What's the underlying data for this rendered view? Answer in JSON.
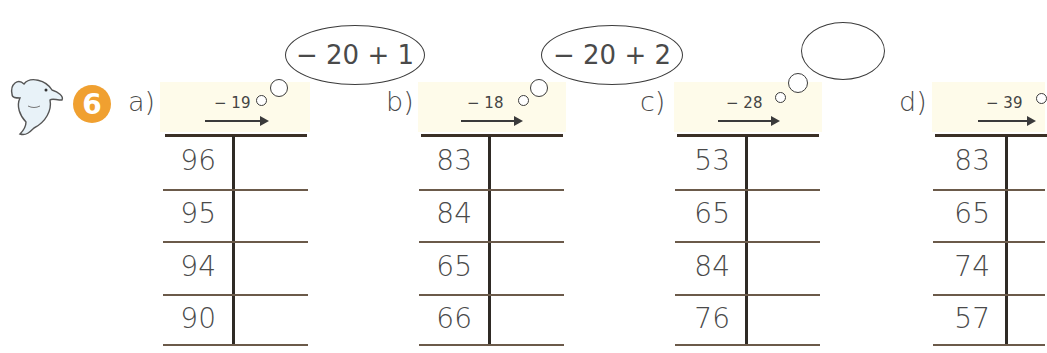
{
  "exercise": {
    "number": "6",
    "badge_color": "#f0a030",
    "icon": "dolphin-icon"
  },
  "parts": [
    {
      "label": "a)",
      "operation": "− 19",
      "thought": "− 20 + 1",
      "rows": [
        "96",
        "95",
        "94",
        "90"
      ],
      "answers": [
        "",
        "",
        "",
        ""
      ]
    },
    {
      "label": "b)",
      "operation": "− 18",
      "thought": "− 20 + 2",
      "rows": [
        "83",
        "84",
        "65",
        "66"
      ],
      "answers": [
        "",
        "",
        "",
        ""
      ]
    },
    {
      "label": "c)",
      "operation": "− 28",
      "thought": "",
      "rows": [
        "53",
        "65",
        "84",
        "76"
      ],
      "answers": [
        "",
        "",
        "",
        ""
      ]
    },
    {
      "label": "d)",
      "operation": "− 39",
      "thought": "",
      "rows": [
        "83",
        "65",
        "74",
        "57"
      ],
      "answers": [
        "",
        "",
        "",
        ""
      ]
    }
  ]
}
